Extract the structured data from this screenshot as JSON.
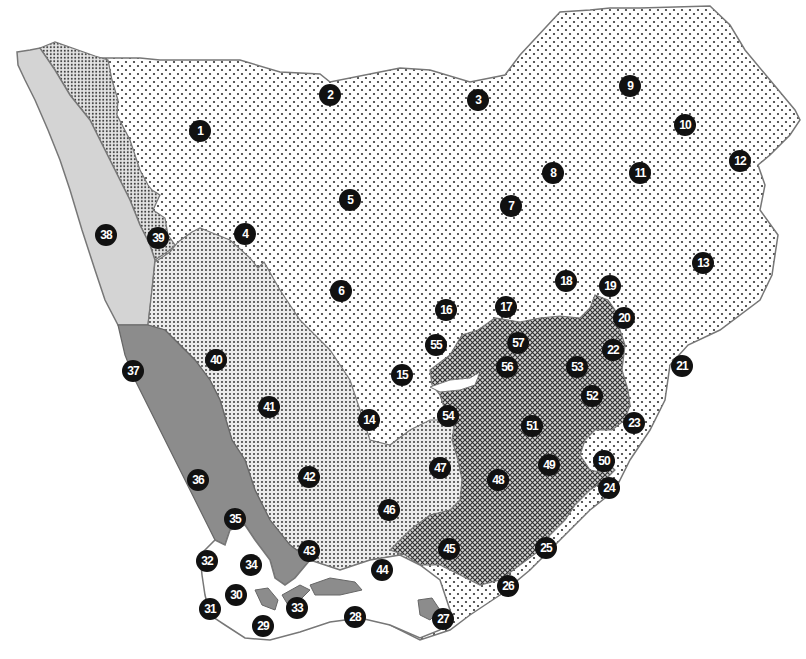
{
  "map": {
    "colors": {
      "background": "#ffffff",
      "outline": "#777777",
      "sparse_dots_fill": "#ffffff",
      "sparse_dots_dot": "#333333",
      "dense_dots_fill": "#e8e8e8",
      "dense_dots_dot": "#444444",
      "crosshatch_fill": "#bbbbbb",
      "crosshatch_dot": "#222222",
      "light_gray": "#d2d2d2",
      "dark_gray": "#8a8a8a",
      "marker": "#111111",
      "marker_text": "#ffffff"
    },
    "regions": [
      {
        "id": "northeast-plateau",
        "pattern": "sparse-dots"
      },
      {
        "id": "northwest-strip",
        "pattern": "dense-dots-fine"
      },
      {
        "id": "west-coast-band",
        "pattern": "light-gray"
      },
      {
        "id": "southwest-karoo",
        "pattern": "dense-dots"
      },
      {
        "id": "southeast-highlands",
        "pattern": "crosshatch"
      },
      {
        "id": "southwest-coast",
        "pattern": "dark-gray"
      },
      {
        "id": "southern-cape",
        "pattern": "white"
      }
    ],
    "markers": [
      {
        "label": "1",
        "x": 200,
        "y": 131
      },
      {
        "label": "2",
        "x": 330,
        "y": 95
      },
      {
        "label": "3",
        "x": 478,
        "y": 100
      },
      {
        "label": "4",
        "x": 245,
        "y": 234
      },
      {
        "label": "5",
        "x": 350,
        "y": 200
      },
      {
        "label": "6",
        "x": 341,
        "y": 291
      },
      {
        "label": "7",
        "x": 511,
        "y": 206
      },
      {
        "label": "8",
        "x": 553,
        "y": 173
      },
      {
        "label": "9",
        "x": 630,
        "y": 86
      },
      {
        "label": "10",
        "x": 685,
        "y": 125
      },
      {
        "label": "11",
        "x": 640,
        "y": 173
      },
      {
        "label": "12",
        "x": 740,
        "y": 161
      },
      {
        "label": "13",
        "x": 703,
        "y": 263
      },
      {
        "label": "14",
        "x": 369,
        "y": 420
      },
      {
        "label": "15",
        "x": 402,
        "y": 375
      },
      {
        "label": "16",
        "x": 446,
        "y": 310
      },
      {
        "label": "17",
        "x": 506,
        "y": 307
      },
      {
        "label": "18",
        "x": 566,
        "y": 281
      },
      {
        "label": "19",
        "x": 610,
        "y": 286
      },
      {
        "label": "20",
        "x": 624,
        "y": 318
      },
      {
        "label": "21",
        "x": 682,
        "y": 366
      },
      {
        "label": "22",
        "x": 613,
        "y": 350
      },
      {
        "label": "23",
        "x": 634,
        "y": 423
      },
      {
        "label": "24",
        "x": 609,
        "y": 488
      },
      {
        "label": "25",
        "x": 546,
        "y": 548
      },
      {
        "label": "26",
        "x": 508,
        "y": 586
      },
      {
        "label": "27",
        "x": 443,
        "y": 619
      },
      {
        "label": "28",
        "x": 355,
        "y": 617
      },
      {
        "label": "29",
        "x": 263,
        "y": 626
      },
      {
        "label": "30",
        "x": 236,
        "y": 595
      },
      {
        "label": "31",
        "x": 210,
        "y": 609
      },
      {
        "label": "32",
        "x": 207,
        "y": 561
      },
      {
        "label": "33",
        "x": 297,
        "y": 608
      },
      {
        "label": "34",
        "x": 251,
        "y": 565
      },
      {
        "label": "35",
        "x": 235,
        "y": 519
      },
      {
        "label": "36",
        "x": 198,
        "y": 480
      },
      {
        "label": "37",
        "x": 133,
        "y": 371
      },
      {
        "label": "38",
        "x": 106,
        "y": 235
      },
      {
        "label": "39",
        "x": 158,
        "y": 238
      },
      {
        "label": "40",
        "x": 216,
        "y": 360
      },
      {
        "label": "41",
        "x": 269,
        "y": 407
      },
      {
        "label": "42",
        "x": 309,
        "y": 477
      },
      {
        "label": "43",
        "x": 309,
        "y": 551
      },
      {
        "label": "44",
        "x": 382,
        "y": 570
      },
      {
        "label": "45",
        "x": 449,
        "y": 549
      },
      {
        "label": "46",
        "x": 389,
        "y": 510
      },
      {
        "label": "47",
        "x": 440,
        "y": 468
      },
      {
        "label": "48",
        "x": 498,
        "y": 480
      },
      {
        "label": "49",
        "x": 549,
        "y": 465
      },
      {
        "label": "50",
        "x": 604,
        "y": 461
      },
      {
        "label": "51",
        "x": 532,
        "y": 426
      },
      {
        "label": "52",
        "x": 592,
        "y": 396
      },
      {
        "label": "53",
        "x": 577,
        "y": 367
      },
      {
        "label": "54",
        "x": 448,
        "y": 416
      },
      {
        "label": "55",
        "x": 436,
        "y": 345
      },
      {
        "label": "56",
        "x": 507,
        "y": 367
      },
      {
        "label": "57",
        "x": 518,
        "y": 343
      }
    ]
  }
}
